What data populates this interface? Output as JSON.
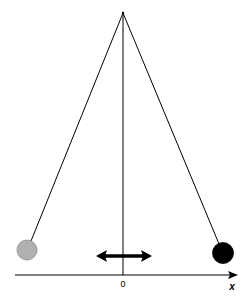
{
  "diagram": {
    "pivot": {
      "x": 123,
      "y": 13
    },
    "axis": {
      "origin_label": "0",
      "axis_label": "x",
      "y": 275,
      "x_start": 15,
      "x_end": 236
    },
    "center_line": {
      "x": 123,
      "y1": 13,
      "y2": 275
    },
    "bobs": [
      {
        "name": "left-bob",
        "cx": 27,
        "cy": 250,
        "r": 10,
        "fill": "#b0b0b0",
        "stroke": "#8a8a8a"
      },
      {
        "name": "right-bob",
        "cx": 223,
        "cy": 253,
        "r": 10.5,
        "fill": "#000000",
        "stroke": "#000000"
      }
    ],
    "motion_arrow": {
      "x1": 96,
      "x2": 152,
      "y": 256,
      "style": "double-headed"
    },
    "colors": {
      "line": "#000000",
      "left_bob": "#b0b0b0",
      "right_bob": "#000000",
      "background": "#ffffff"
    }
  }
}
